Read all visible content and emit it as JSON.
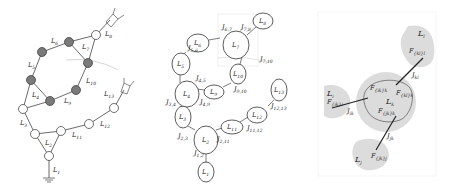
{
  "panel_a": {
    "links": [
      "L1",
      "L2",
      "L3",
      "L4",
      "L5",
      "L6",
      "L7",
      "L8",
      "L9",
      "L10",
      "L11",
      "L12",
      "L13"
    ],
    "labels": {
      "L1": {
        "base": "L",
        "sub": "1"
      },
      "L2": {
        "base": "L",
        "sub": "2"
      },
      "L3": {
        "base": "L",
        "sub": "3"
      },
      "L4": {
        "base": "L",
        "sub": "4"
      },
      "L5": {
        "base": "L",
        "sub": "5"
      },
      "L6": {
        "base": "L",
        "sub": "6"
      },
      "L7": {
        "base": "L",
        "sub": "7"
      },
      "L8": {
        "base": "L",
        "sub": "8"
      },
      "L9": {
        "base": "L",
        "sub": "9"
      },
      "L10": {
        "base": "L",
        "sub": "10"
      },
      "L11": {
        "base": "L",
        "sub": "11"
      },
      "L12": {
        "base": "L",
        "sub": "12"
      },
      "L13": {
        "base": "L",
        "sub": "13"
      }
    },
    "joint_fill_closed_loop": "#7a7a7a",
    "joint_fill_open": "#ffffff"
  },
  "panel_b": {
    "links": [
      {
        "id": "L1",
        "base": "L",
        "sub": "1"
      },
      {
        "id": "L2",
        "base": "L",
        "sub": "2"
      },
      {
        "id": "L3",
        "base": "L",
        "sub": "3"
      },
      {
        "id": "L4",
        "base": "L",
        "sub": "4"
      },
      {
        "id": "L5",
        "base": "L",
        "sub": "5"
      },
      {
        "id": "L6",
        "base": "L",
        "sub": "6"
      },
      {
        "id": "L7",
        "base": "L",
        "sub": "7"
      },
      {
        "id": "L8",
        "base": "L",
        "sub": "8"
      },
      {
        "id": "L9",
        "base": "L",
        "sub": "9"
      },
      {
        "id": "L10",
        "base": "L",
        "sub": "10"
      },
      {
        "id": "L11",
        "base": "L",
        "sub": "11"
      },
      {
        "id": "L12",
        "base": "L",
        "sub": "12"
      },
      {
        "id": "L13",
        "base": "L",
        "sub": "13"
      }
    ],
    "joints": [
      {
        "base": "J",
        "sub": "1,2"
      },
      {
        "base": "J",
        "sub": "2,3"
      },
      {
        "base": "J",
        "sub": "2,11"
      },
      {
        "base": "J",
        "sub": "3,4"
      },
      {
        "base": "J",
        "sub": "4,5"
      },
      {
        "base": "J",
        "sub": "4,9"
      },
      {
        "base": "J",
        "sub": "5,6"
      },
      {
        "base": "J",
        "sub": "6,7"
      },
      {
        "base": "J",
        "sub": "7,8"
      },
      {
        "base": "J",
        "sub": "7,10"
      },
      {
        "base": "J",
        "sub": "9,10"
      },
      {
        "base": "J",
        "sub": "11,12"
      },
      {
        "base": "J",
        "sub": "12,13"
      }
    ]
  },
  "panel_c": {
    "links": {
      "center": {
        "base": "L",
        "sub": "k"
      },
      "top": {
        "base": "L",
        "sub": "l"
      },
      "left": {
        "base": "L",
        "sub": "i"
      },
      "bottom": {
        "base": "L",
        "sub": "j"
      }
    },
    "joints": {
      "kl": {
        "base": "J",
        "sub": "kl"
      },
      "ik": {
        "base": "J",
        "sub": "ik"
      },
      "jk": {
        "base": "J",
        "sub": "jk"
      }
    },
    "frames": {
      "top": {
        "base": "F",
        "sub": "{kl}l"
      },
      "center_right": {
        "base": "F",
        "sub": "{kl}k"
      },
      "center_left": {
        "base": "F",
        "sub": "{ik}k"
      },
      "center_bottom": {
        "base": "F",
        "sub": "{jk}k"
      },
      "left": {
        "base": "F",
        "sub": "{ik}i"
      },
      "bottom": {
        "base": "F",
        "sub": "{jk}j"
      }
    },
    "blob_fill": "#dcdcdc",
    "frame_box_stroke": "#cccccc"
  }
}
